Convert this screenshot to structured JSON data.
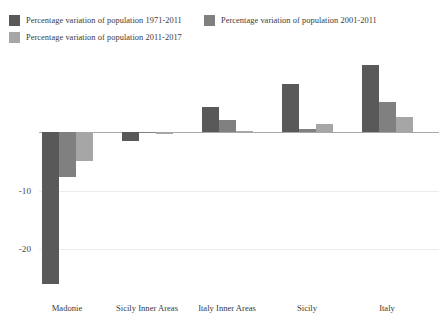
{
  "chart_data": {
    "type": "bar",
    "title": "",
    "subtitle": "",
    "xlabel": "",
    "ylabel": "",
    "grid": true,
    "legend_position": "top-left",
    "ylim": [
      -28,
      13
    ],
    "yticks": [
      -10,
      -20
    ],
    "ytick_labels": [
      "-10",
      "-20"
    ],
    "categories": [
      "Madonie",
      "Sicily Inner Areas",
      "Italy Inner Areas",
      "Sicily",
      "Italy"
    ],
    "series": [
      {
        "name": "Percentage variation of population 1971-2011",
        "color": "#595959",
        "values": [
          -26.0,
          -1.6,
          4.3,
          8.3,
          11.5
        ]
      },
      {
        "name": "Percentage variation of population 2001-2011",
        "color": "#808080",
        "values": [
          -7.7,
          -0.2,
          2.1,
          0.5,
          5.1
        ]
      },
      {
        "name": "Percentage variation of population 2011-2017",
        "color": "#a6a6a6",
        "values": [
          -4.9,
          -0.3,
          0.2,
          1.3,
          2.6
        ]
      }
    ]
  },
  "colors": {
    "series_1971_2011": "#595959",
    "series_2001_2011": "#808080",
    "series_2011_2017": "#a6a6a6",
    "axis": "#a8a8a8",
    "grid": "#ececec",
    "text": "#3a3a3a",
    "background": "#ffffff"
  },
  "legend": {
    "entries": [
      {
        "label": "Percentage variation of population 1971-2011",
        "color": "#595959"
      },
      {
        "label": "Percentage variation of population 2001-2011",
        "color": "#808080"
      },
      {
        "label": "Percentage variation of population 2011-2017",
        "color": "#a6a6a6"
      }
    ]
  },
  "axis": {
    "y_tick_labels": [
      "-10",
      "-20"
    ],
    "x_tick_labels": [
      "Madonie",
      "Sicily Inner Areas",
      "Italy Inner Areas",
      "Sicily",
      "Italy"
    ]
  }
}
